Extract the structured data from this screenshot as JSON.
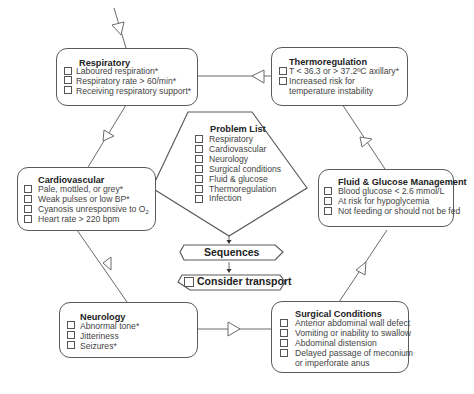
{
  "diagram": {
    "respiratory": {
      "title": "Respiratory",
      "items": [
        "Laboured respiration*",
        "Respiratory rate > 60/min*",
        "Receiving respiratory support*"
      ]
    },
    "thermoregulation": {
      "title": "Thermoregulation",
      "items": [
        "T < 36.3 or > 37.2ºC axillary*",
        "Increased risk for",
        "temperature instability"
      ]
    },
    "cardiovascular": {
      "title": "Cardiovascular",
      "items": [
        "Pale, mottled, or grey*",
        "Weak pulses or low BP*",
        "Cyanosis unresponsive to O",
        "Heart rate > 220 bpm"
      ],
      "subscript": "2"
    },
    "fluid_glucose": {
      "title": "Fluid & Glucose Management",
      "items": [
        "Blood glucose < 2.6 mmol/L",
        "At risk for hypoglycemia",
        "Not feeding or should not be fed"
      ]
    },
    "neurology": {
      "title": "Neurology",
      "items": [
        "Abnormal tone*",
        "Jitteriness",
        "Seizures*"
      ]
    },
    "surgical": {
      "title": "Surgical Conditions",
      "items": [
        "Anterior abdominal wall defect",
        "Vomiting or inability to swallow",
        "Abdominal distension",
        "Delayed passage of meconium",
        "or imperforate anus"
      ]
    },
    "problem_list": {
      "title": "Problem List",
      "items": [
        "Respiratory",
        "Cardiovascular",
        "Neurology",
        "Surgical conditions",
        "Fluid & glucose",
        "Thermoregulation",
        "Infection"
      ]
    },
    "sequences": {
      "label": "Sequences"
    },
    "consider_transport": {
      "label": "Consider transport"
    }
  }
}
